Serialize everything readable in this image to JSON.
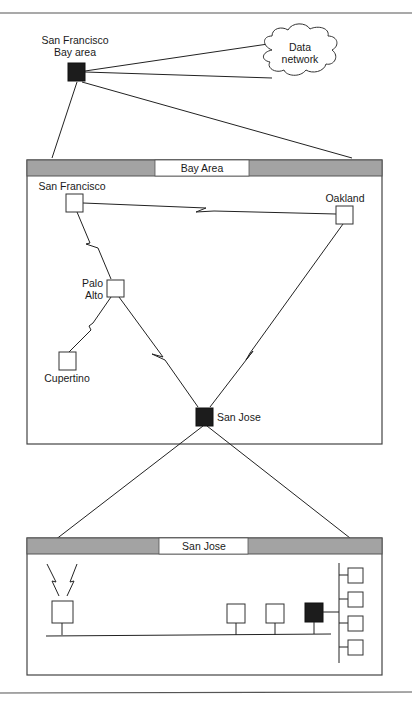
{
  "diagram": {
    "top": {
      "hub_label_line1": "San Francisco",
      "hub_label_line2": "Bay area",
      "cloud_label_line1": "Data",
      "cloud_label_line2": "network"
    },
    "bay_area": {
      "title": "Bay Area",
      "nodes": [
        {
          "id": "san-francisco",
          "label": "San Francisco",
          "type": "node"
        },
        {
          "id": "oakland",
          "label": "Oakland",
          "type": "node"
        },
        {
          "id": "palo-alto",
          "label_line1": "Palo",
          "label_line2": "Alto",
          "type": "node"
        },
        {
          "id": "cupertino",
          "label": "Cupertino",
          "type": "node"
        },
        {
          "id": "san-jose",
          "label": "San Jose",
          "type": "hub"
        }
      ],
      "links": [
        {
          "from": "san-francisco",
          "to": "oakland",
          "style": "wan"
        },
        {
          "from": "san-francisco",
          "to": "palo-alto",
          "style": "wan"
        },
        {
          "from": "palo-alto",
          "to": "cupertino",
          "style": "wan"
        },
        {
          "from": "palo-alto",
          "to": "san-jose",
          "style": "wan"
        },
        {
          "from": "oakland",
          "to": "san-jose",
          "style": "wan"
        }
      ]
    },
    "san_jose": {
      "title": "San Jose",
      "lan_nodes": 4,
      "hub_count": 1,
      "branch_nodes": 4
    },
    "colors": {
      "band": "#a3a3a3",
      "hub": "#1c1c1c",
      "line": "#222222"
    }
  }
}
